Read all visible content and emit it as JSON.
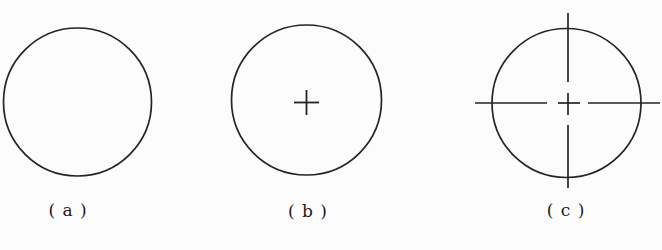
{
  "figure": {
    "stroke_color": "#242424",
    "label_color": "#1a1a1a",
    "background_color": "#fcfcfc",
    "panels": [
      {
        "name": "plain-circle",
        "label": "( a )"
      },
      {
        "name": "circle-with-center-mark",
        "label": "( b )"
      },
      {
        "name": "circle-with-centerlines",
        "label": "( c )"
      }
    ]
  }
}
